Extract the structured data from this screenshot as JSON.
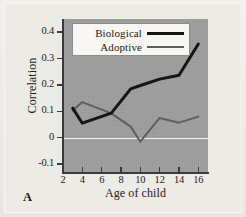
{
  "figure": {
    "panel_letter": "A"
  },
  "chart_data": {
    "type": "line",
    "title": "",
    "xlabel": "Age of child",
    "ylabel": "Correlation",
    "xlim": [
      2,
      17
    ],
    "ylim": [
      -0.13,
      0.45
    ],
    "grid": false,
    "zero_line": true,
    "legend_position": "top-left-inside",
    "xticks": [
      2,
      4,
      6,
      8,
      10,
      12,
      14,
      16
    ],
    "xtick_labels": [
      "2",
      "4",
      "6",
      "8",
      "10",
      "12",
      "14",
      "16"
    ],
    "yticks": [
      0.4,
      0.3,
      0.2,
      0.1,
      0,
      -0.1
    ],
    "ytick_labels": [
      "0.4",
      "0.3",
      "0.2",
      "0.1",
      "0",
      "-0.1"
    ],
    "series": [
      {
        "name": "Biological",
        "color": "#151515",
        "width": 3,
        "x": [
          3,
          4,
          7,
          9,
          10,
          12,
          14,
          16
        ],
        "values": [
          0.112,
          0.055,
          0.093,
          0.185,
          0.198,
          0.222,
          0.237,
          0.355
        ]
      },
      {
        "name": "Adoptive",
        "color": "#5e5e5e",
        "width": 2,
        "x": [
          3,
          4,
          7,
          9,
          10,
          12,
          14,
          16
        ],
        "values": [
          0.103,
          0.135,
          0.092,
          0.042,
          -0.015,
          0.075,
          0.057,
          0.08
        ]
      }
    ]
  },
  "legend": {
    "items": [
      {
        "label": "Biological"
      },
      {
        "label": "Adoptive"
      }
    ]
  },
  "colors": {
    "plot_background": "#9d9d9d",
    "page_background": "#edebe5",
    "axis": "#3a3a3a",
    "zero_line": "#ffffff",
    "biological": "#151515",
    "adoptive": "#5e5e5e"
  }
}
